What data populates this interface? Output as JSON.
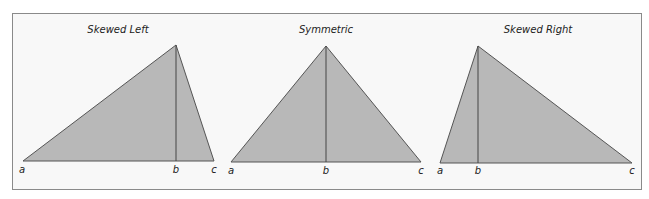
{
  "colors": {
    "fill": "#b8b8b8",
    "stroke": "#555555",
    "frame": "#8a8a8a",
    "background": "#f8f8f8"
  },
  "panels": [
    {
      "title": "Skewed Left",
      "labels": {
        "a": "a",
        "b": "b",
        "c": "c"
      },
      "vertices": {
        "a": [
          23,
          161
        ],
        "apex": [
          176,
          45
        ],
        "c": [
          214,
          161
        ]
      },
      "b_x": 176
    },
    {
      "title": "Symmetric",
      "labels": {
        "a": "a",
        "b": "b",
        "c": "c"
      },
      "vertices": {
        "a": [
          231,
          162
        ],
        "apex": [
          326,
          46
        ],
        "c": [
          421,
          162
        ]
      },
      "b_x": 326
    },
    {
      "title": "Skewed Right",
      "labels": {
        "a": "a",
        "b": "b",
        "c": "c"
      },
      "vertices": {
        "a": [
          440,
          163
        ],
        "apex": [
          478,
          46
        ],
        "c": [
          632,
          163
        ]
      },
      "b_x": 478
    }
  ]
}
